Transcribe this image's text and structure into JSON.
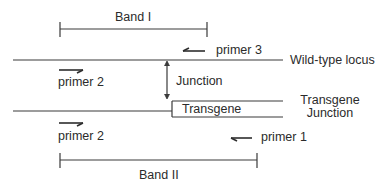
{
  "diagram": {
    "band_top": {
      "label": "Band I"
    },
    "band_bottom": {
      "label": "Band II"
    },
    "wild_type": {
      "label": "Wild-type locus"
    },
    "junction": {
      "label": "Junction"
    },
    "transgene_box": {
      "label": "Transgene"
    },
    "transgene_junction": {
      "line1": "Transgene",
      "line2": "Junction"
    },
    "primers": {
      "primer3": {
        "label": "primer 3",
        "direction": "left"
      },
      "primer2_top": {
        "label": "primer 2",
        "direction": "right"
      },
      "primer2_bottom": {
        "label": "primer 2",
        "direction": "right"
      },
      "primer1": {
        "label": "primer 1",
        "direction": "left"
      }
    },
    "colors": {
      "line": "#3a3a3a",
      "background": "#ffffff"
    }
  }
}
